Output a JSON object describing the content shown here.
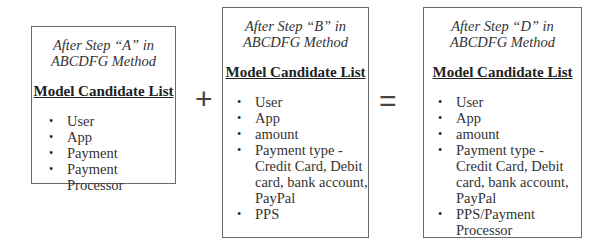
{
  "boxes": [
    {
      "subtitle_line1": "After Step “A” in",
      "subtitle_line2": "ABCDFG Method",
      "heading": "Model Candidate List",
      "items": [
        "User",
        "App",
        "Payment",
        "Payment Processor"
      ]
    },
    {
      "subtitle_line1": "After Step “B” in",
      "subtitle_line2": "ABCDFG Method",
      "heading": "Model Candidate List",
      "items": [
        "User",
        "App",
        "amount",
        "Payment type - Credit Card, Debit card, bank account, PayPal",
        "PPS"
      ]
    },
    {
      "subtitle_line1": "After Step “D” in",
      "subtitle_line2": "ABCDFG Method",
      "heading": "Model Candidate List",
      "items": [
        "User",
        "App",
        "amount",
        "Payment type - Credit Card, Debit card, bank account, PayPal",
        "PPS/Payment Processor"
      ]
    }
  ],
  "operators": {
    "plus": "+",
    "equals": "="
  },
  "bullet": "•"
}
